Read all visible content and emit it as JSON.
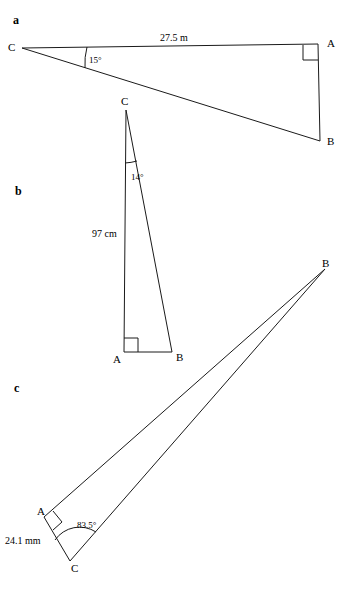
{
  "figure": {
    "background_color": "#ffffff",
    "stroke_color": "#1a1a1a",
    "parts": [
      {
        "part_label": "a",
        "part_label_pos": {
          "x": 13,
          "y": 14
        },
        "vertices": [
          {
            "name": "C",
            "label": "C",
            "x": 22,
            "y": 48,
            "label_x": 8,
            "label_y": 42
          },
          {
            "name": "A",
            "label": "A",
            "x": 318,
            "y": 44,
            "label_x": 327,
            "label_y": 38
          },
          {
            "name": "B",
            "label": "B",
            "x": 320,
            "y": 141,
            "label_x": 327,
            "label_y": 136
          }
        ],
        "side_label": {
          "text": "27.5 m",
          "x": 160,
          "y": 33
        },
        "angle_label": {
          "text": "15°",
          "x": 89,
          "y": 56,
          "vertex": "C",
          "value": 15
        },
        "right_angle_at": "A"
      },
      {
        "part_label": "b",
        "part_label_pos": {
          "x": 15,
          "y": 185
        },
        "vertices": [
          {
            "name": "C",
            "label": "C",
            "x": 126,
            "y": 110,
            "label_x": 121,
            "label_y": 96
          },
          {
            "name": "A",
            "label": "A",
            "x": 124,
            "y": 352,
            "label_x": 113,
            "label_y": 354
          },
          {
            "name": "B",
            "label": "B",
            "x": 172,
            "y": 352,
            "label_x": 176,
            "label_y": 352
          }
        ],
        "side_label": {
          "text": "97 cm",
          "x": 92,
          "y": 229
        },
        "angle_label": {
          "text": "14°",
          "x": 131,
          "y": 173,
          "vertex": "C",
          "value": 14
        },
        "right_angle_at": "A"
      },
      {
        "part_label": "c",
        "part_label_pos": {
          "x": 14,
          "y": 382
        },
        "vertices": [
          {
            "name": "B",
            "label": "B",
            "x": 325,
            "y": 269,
            "label_x": 322,
            "label_y": 258
          },
          {
            "name": "A",
            "label": "A",
            "x": 44,
            "y": 517,
            "label_x": 37,
            "label_y": 506
          },
          {
            "name": "C",
            "label": "C",
            "x": 70,
            "y": 561,
            "label_x": 71,
            "label_y": 563
          }
        ],
        "side_label": {
          "text": "24.1 mm",
          "x": 5,
          "y": 536
        },
        "angle_label": {
          "text": "83.5°",
          "x": 77,
          "y": 521,
          "vertex": "C",
          "value": 83.5
        },
        "right_angle_at": "A"
      }
    ]
  }
}
